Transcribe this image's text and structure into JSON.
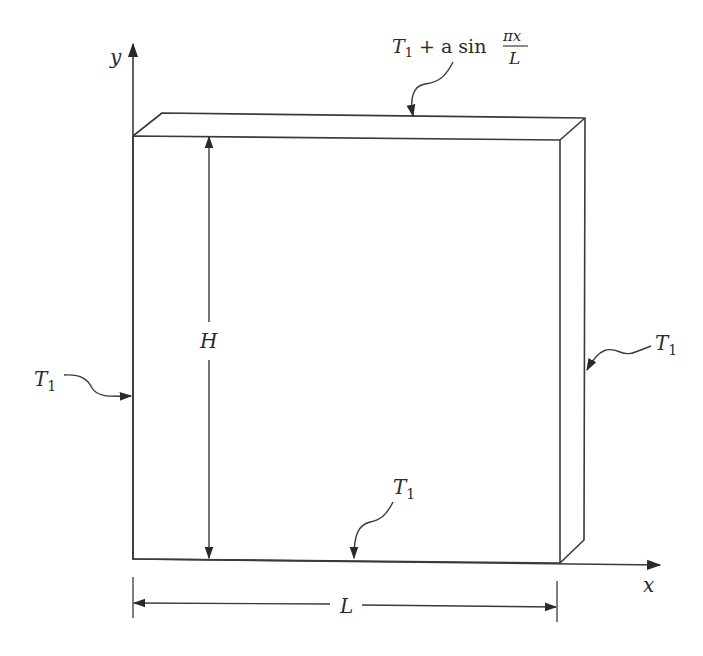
{
  "figure": {
    "type": "heat-conduction-plate-diagram",
    "axes": {
      "x_label": "x",
      "y_label": "y"
    },
    "dimensions": {
      "height_label": "H",
      "length_label": "L"
    },
    "boundary_conditions": {
      "top": {
        "base": "T",
        "sub": "1",
        "plus": " + a sin ",
        "frac_num": "πx",
        "frac_den": "L"
      },
      "left": {
        "base": "T",
        "sub": "1"
      },
      "right": {
        "base": "T",
        "sub": "1"
      },
      "bottom": {
        "base": "T",
        "sub": "1"
      }
    },
    "colors": {
      "line": "#3a3a3a",
      "text": "#2a2a2a",
      "background": "#ffffff"
    }
  }
}
